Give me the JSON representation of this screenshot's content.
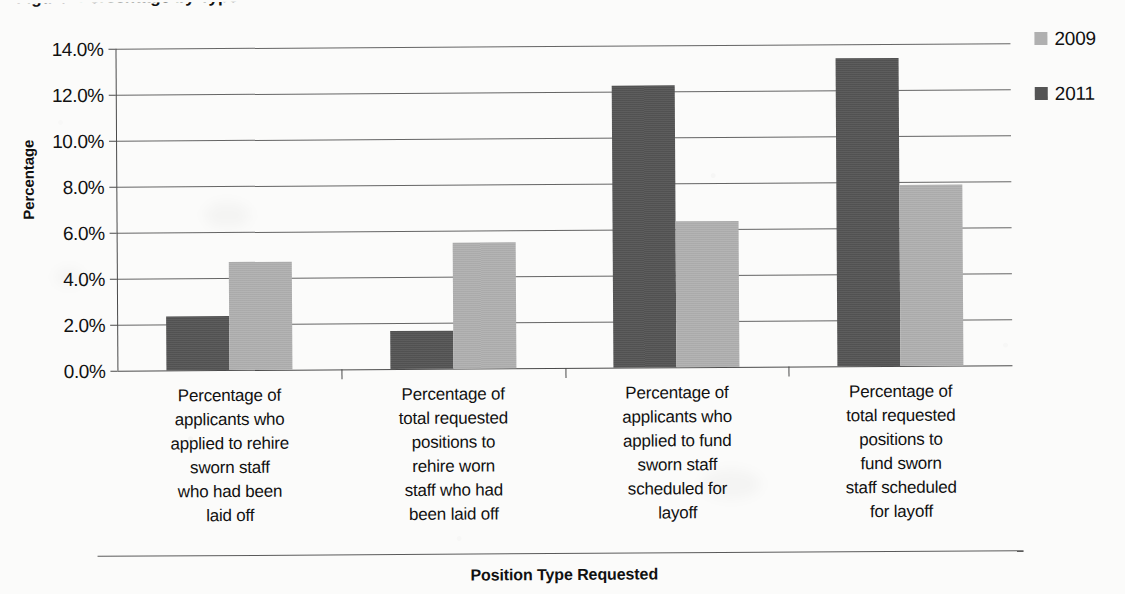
{
  "chart_data": {
    "type": "bar",
    "title": "",
    "xlabel": "Position Type Requested",
    "ylabel": "Percentage",
    "ylim": [
      0,
      14
    ],
    "ytick_labels": [
      "14.0%",
      "12.0%",
      "10.0%",
      "8.0%",
      "6.0%",
      "4.0%",
      "2.0%",
      "0.0%"
    ],
    "ytick_values": [
      14,
      12,
      10,
      8,
      6,
      4,
      2,
      0
    ],
    "grid": true,
    "legend_position": "right",
    "categories": [
      "Percentage of applicants who applied to rehire sworn staff who had been laid off",
      "Percentage of total requested positions to rehire worn staff who had been laid off",
      "Percentage of applicants who applied to fund sworn staff scheduled for layoff",
      "Percentage of total requested positions to fund sworn staff scheduled for layoff"
    ],
    "category_lines": [
      [
        "Percentage of",
        "applicants who",
        "applied to rehire",
        "sworn staff",
        "who had been",
        "laid off"
      ],
      [
        "Percentage of",
        "total requested",
        "positions to",
        "rehire worn",
        "staff who had",
        "been laid off"
      ],
      [
        "Percentage of",
        "applicants who",
        "applied to fund",
        "sworn staff",
        "scheduled for",
        "layoff"
      ],
      [
        "Percentage of",
        "total requested",
        "positions to",
        "fund sworn",
        "staff scheduled",
        "for layoff"
      ]
    ],
    "series": [
      {
        "name": "2009",
        "color": "#b0b0b0",
        "values": [
          4.7,
          5.5,
          6.35,
          7.85
        ]
      },
      {
        "name": "2011",
        "color": "#545454",
        "values": [
          2.35,
          1.65,
          12.25,
          13.4
        ]
      }
    ],
    "series_draw_order": [
      "2011",
      "2009"
    ]
  },
  "legend": {
    "items": [
      {
        "label": "2009",
        "color": "#b0b0b0"
      },
      {
        "label": "2011",
        "color": "#545454"
      }
    ]
  },
  "axes": {
    "y_title": "Percentage",
    "x_title": "Position Type Requested"
  },
  "page": {
    "title_partial": "Figure: Percentage by Type"
  }
}
